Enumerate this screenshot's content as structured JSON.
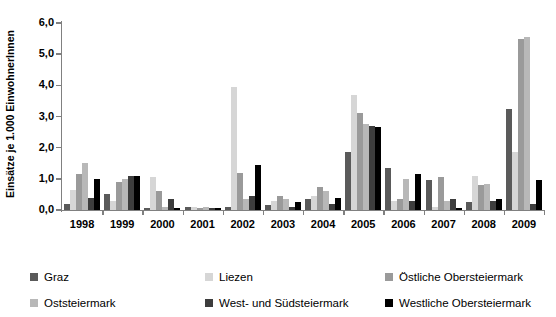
{
  "chart_data": {
    "type": "bar",
    "title": "",
    "xlabel": "",
    "ylabel": "Einsätze je 1.000 EinwohnerInnen",
    "ylim": [
      0,
      6
    ],
    "ytick_labels": [
      "0,0",
      "1,0",
      "2,0",
      "3,0",
      "4,0",
      "5,0",
      "6,0"
    ],
    "ytick_values": [
      0,
      1,
      2,
      3,
      4,
      5,
      6
    ],
    "grid": false,
    "legend_position": "bottom",
    "categories": [
      "1998",
      "1999",
      "2000",
      "2001",
      "2002",
      "2003",
      "2004",
      "2005",
      "2006",
      "2007",
      "2008",
      "2009"
    ],
    "series": [
      {
        "name": "Graz",
        "color": "#5a5a5a",
        "values": [
          0.2,
          0.5,
          0.05,
          0.1,
          0.1,
          0.15,
          0.35,
          1.85,
          1.35,
          0.95,
          0.25,
          3.25
        ]
      },
      {
        "name": "Liezen",
        "color": "#d6d6d6",
        "values": [
          0.65,
          0.3,
          1.05,
          0.1,
          3.95,
          0.3,
          0.45,
          3.7,
          0.3,
          0.1,
          1.1,
          1.85
        ]
      },
      {
        "name": "Östliche Obersteiermark",
        "color": "#9a9a9a",
        "values": [
          1.15,
          0.9,
          0.6,
          0.05,
          1.2,
          0.45,
          0.75,
          3.1,
          0.35,
          1.05,
          0.8,
          5.5
        ]
      },
      {
        "name": "Oststeiermark",
        "color": "#b8b8b8",
        "values": [
          1.5,
          1.0,
          0.1,
          0.1,
          0.35,
          0.35,
          0.6,
          2.75,
          1.0,
          0.3,
          0.85,
          5.55
        ]
      },
      {
        "name": "West- und Südsteiermark",
        "color": "#3d3d3d",
        "values": [
          0.4,
          1.1,
          0.35,
          0.05,
          0.45,
          0.1,
          0.2,
          2.7,
          0.3,
          0.35,
          0.3,
          0.2
        ]
      },
      {
        "name": "Westliche Obersteiermark",
        "color": "#000000",
        "values": [
          1.0,
          1.1,
          0.05,
          0.05,
          1.45,
          0.25,
          0.4,
          2.65,
          1.15,
          0.05,
          0.35,
          0.95
        ]
      }
    ]
  }
}
